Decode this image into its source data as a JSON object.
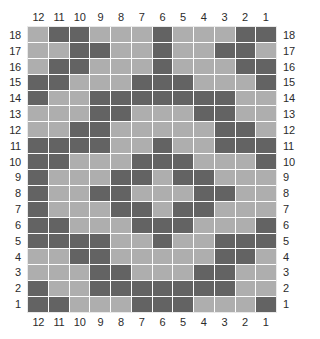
{
  "chart_data": {
    "type": "heatmap",
    "title": "",
    "xlabel": "",
    "ylabel": "",
    "grid": true,
    "legend_position": "none",
    "columns_count": 12,
    "rows_count": 18,
    "column_labels_top": [
      "12",
      "11",
      "10",
      "9",
      "8",
      "7",
      "6",
      "5",
      "4",
      "3",
      "2",
      "1"
    ],
    "column_labels_bottom": [
      "12",
      "11",
      "10",
      "9",
      "8",
      "7",
      "6",
      "5",
      "4",
      "3",
      "2",
      "1"
    ],
    "row_labels_left": [
      "18",
      "17",
      "16",
      "15",
      "14",
      "13",
      "12",
      "11",
      "10",
      "9",
      "8",
      "7",
      "6",
      "5",
      "4",
      "3",
      "2",
      "1"
    ],
    "row_labels_right": [
      "18",
      "17",
      "16",
      "15",
      "14",
      "13",
      "12",
      "11",
      "10",
      "9",
      "8",
      "7",
      "6",
      "5",
      "4",
      "3",
      "2",
      "1"
    ],
    "colors": {
      "filled": "#636363",
      "empty": "#aeaeae",
      "gridline": "#fdfdfd",
      "label_text": "#2b2b2b",
      "background": "#ffffff"
    },
    "cell_states_note": "Rows listed top (row 18) to bottom (row 1); each row lists 12 values left-to-right matching column labels 12..1. 1 = filled (dark), 0 = empty (light).",
    "values": [
      [
        0,
        1,
        1,
        0,
        0,
        0,
        1,
        0,
        0,
        0,
        1,
        1
      ],
      [
        0,
        0,
        1,
        1,
        0,
        0,
        1,
        0,
        0,
        1,
        1,
        0
      ],
      [
        0,
        1,
        1,
        0,
        0,
        0,
        1,
        0,
        0,
        0,
        1,
        1
      ],
      [
        1,
        1,
        0,
        0,
        0,
        1,
        1,
        1,
        0,
        0,
        0,
        1
      ],
      [
        1,
        0,
        0,
        1,
        1,
        1,
        1,
        1,
        1,
        1,
        0,
        0
      ],
      [
        0,
        0,
        0,
        1,
        1,
        0,
        0,
        0,
        1,
        1,
        0,
        0
      ],
      [
        0,
        0,
        1,
        1,
        0,
        0,
        0,
        0,
        0,
        1,
        1,
        0
      ],
      [
        1,
        1,
        1,
        1,
        0,
        0,
        1,
        0,
        0,
        1,
        1,
        1
      ],
      [
        1,
        1,
        0,
        0,
        0,
        1,
        1,
        1,
        0,
        0,
        0,
        1
      ],
      [
        1,
        0,
        0,
        0,
        1,
        1,
        0,
        1,
        1,
        0,
        0,
        0
      ],
      [
        1,
        0,
        0,
        1,
        1,
        0,
        0,
        0,
        1,
        1,
        0,
        0
      ],
      [
        1,
        0,
        0,
        0,
        1,
        1,
        0,
        1,
        1,
        0,
        0,
        0
      ],
      [
        1,
        1,
        0,
        0,
        0,
        1,
        1,
        1,
        0,
        0,
        0,
        1
      ],
      [
        1,
        1,
        1,
        1,
        0,
        0,
        1,
        0,
        0,
        1,
        1,
        1
      ],
      [
        0,
        0,
        1,
        1,
        0,
        0,
        0,
        0,
        0,
        1,
        1,
        0
      ],
      [
        0,
        0,
        0,
        1,
        1,
        0,
        0,
        0,
        1,
        1,
        0,
        0
      ],
      [
        1,
        0,
        0,
        1,
        1,
        1,
        1,
        1,
        1,
        1,
        0,
        0
      ],
      [
        1,
        1,
        0,
        0,
        0,
        1,
        1,
        1,
        0,
        0,
        0,
        1
      ]
    ]
  }
}
